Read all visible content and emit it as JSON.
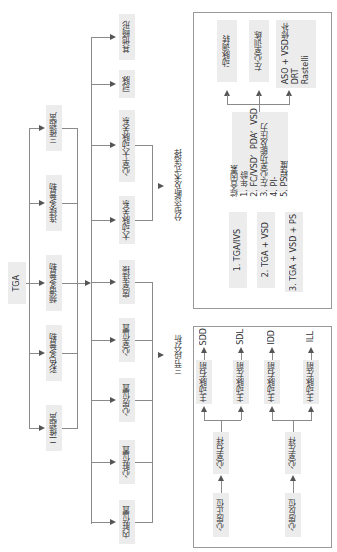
{
  "root": {
    "label": "TGA"
  },
  "imaging_methods": [
    {
      "label": "三维超声"
    },
    {
      "label": "连续多普勒"
    },
    {
      "label": "频谱多普勒"
    },
    {
      "label": "彩色多普勒"
    },
    {
      "label": "二维超声"
    }
  ],
  "segments": [
    {
      "label": "其他畸形"
    },
    {
      "label": "冠脉"
    },
    {
      "label": "心室-大动脉关系"
    },
    {
      "label": "大动脉关系"
    },
    {
      "label": "房室连接"
    },
    {
      "label": "心室位置"
    },
    {
      "label": "心房位置"
    },
    {
      "label": "心脏位置"
    },
    {
      "label": "内脏位置"
    }
  ],
  "analysis": {
    "typing": "分型诊断及术式选择",
    "three_segment": "三节段分析"
  },
  "surgery_panel": {
    "outcomes": [
      {
        "label": "动脉调转"
      },
      {
        "label": "左心室训练"
      },
      {
        "label": "ASO + VSD修补\nDRT\nRastelli"
      }
    ],
    "factors": "综合因素\n1. 年龄\n2. FC/VSD、PDA、VSD\n3. 左心室功能及压力\n4. PI-\n5. PS程度",
    "types": [
      {
        "label": "1.  TGA/IVS"
      },
      {
        "label": "2.  TGA + VSD"
      },
      {
        "label": "3.  TGA + VSD + PS"
      }
    ]
  },
  "segment_panel": {
    "chains": [
      {
        "atrium": "心房正位",
        "ventricle": "心室右袢",
        "aorta_a": "主动脉右前",
        "code_a": "SDD",
        "aorta_b": "主动脉左前",
        "code_b": "SDL"
      },
      {
        "atrium": "心房反位",
        "ventricle": "心室左袢",
        "aorta_a": "主动脉右前",
        "code_a": "IDD",
        "aorta_b": "主动脉左前",
        "code_b": "ILL"
      }
    ]
  }
}
